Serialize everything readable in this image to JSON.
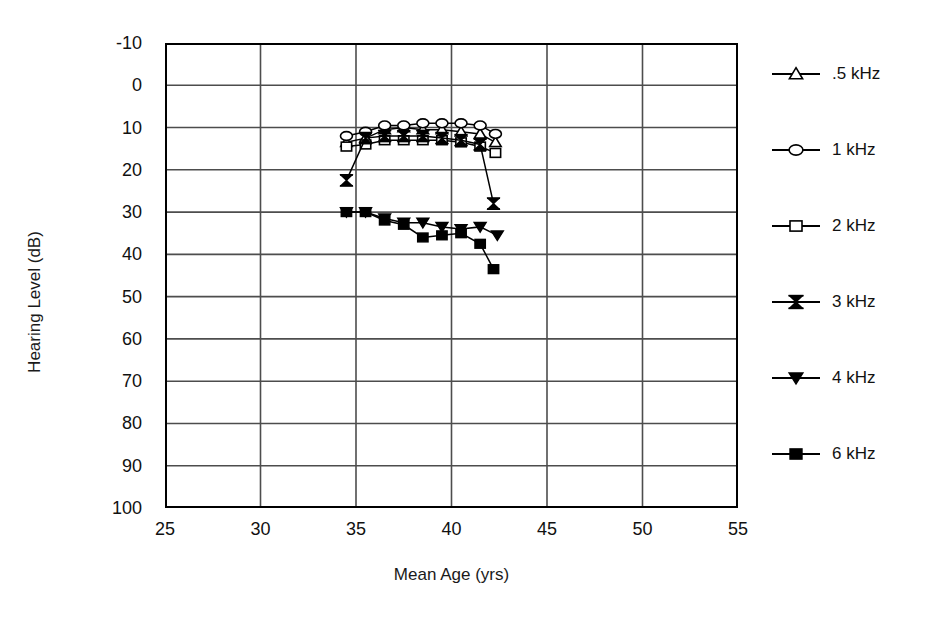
{
  "chart_data": {
    "type": "line",
    "title": "",
    "xlabel": "Mean Age (yrs)",
    "ylabel": "Hearing Level (dB)",
    "xlim": [
      25,
      55
    ],
    "ylim": [
      -10,
      100
    ],
    "y_inverted": true,
    "xticks": [
      25,
      30,
      35,
      40,
      45,
      50,
      55
    ],
    "yticks": [
      -10,
      0,
      10,
      20,
      30,
      40,
      50,
      60,
      70,
      80,
      90,
      100
    ],
    "grid": "both",
    "legend_position": "right",
    "series": [
      {
        "name": ".5 kHz",
        "marker": "open-triangle",
        "x": [
          34.5,
          35.5,
          36.5,
          37.5,
          38.5,
          39.5,
          40.5,
          41.5,
          42.3
        ],
        "y": [
          13.5,
          12.5,
          10.5,
          10.0,
          10.5,
          10.5,
          11.0,
          11.5,
          13.5
        ]
      },
      {
        "name": "1 kHz",
        "marker": "open-circle",
        "x": [
          34.5,
          35.5,
          36.5,
          37.5,
          38.5,
          39.5,
          40.5,
          41.5,
          42.3
        ],
        "y": [
          12.0,
          11.0,
          9.5,
          9.5,
          9.0,
          9.0,
          9.0,
          9.5,
          11.5
        ]
      },
      {
        "name": "2 kHz",
        "marker": "open-square",
        "x": [
          34.5,
          35.5,
          36.5,
          37.5,
          38.5,
          39.5,
          40.5,
          41.5,
          42.3
        ],
        "y": [
          14.5,
          14.0,
          13.0,
          13.0,
          13.0,
          13.0,
          13.5,
          14.5,
          16.0
        ]
      },
      {
        "name": "3 kHz",
        "marker": "filled-bowtie",
        "x": [
          34.5,
          35.5,
          36.5,
          37.5,
          38.5,
          39.5,
          40.5,
          41.5,
          42.2
        ],
        "y": [
          22.5,
          12.5,
          12.0,
          12.0,
          12.0,
          12.5,
          13.0,
          14.0,
          28.0
        ]
      },
      {
        "name": "4 kHz",
        "marker": "filled-down-triangle",
        "x": [
          34.5,
          35.5,
          36.5,
          37.5,
          38.5,
          39.5,
          40.5,
          41.5,
          42.4
        ],
        "y": [
          30.0,
          30.0,
          31.5,
          32.5,
          32.5,
          33.5,
          34.0,
          33.5,
          35.5
        ]
      },
      {
        "name": "6 kHz",
        "marker": "filled-square",
        "x": [
          34.5,
          35.5,
          36.5,
          37.5,
          38.5,
          39.5,
          40.5,
          41.5,
          42.2
        ],
        "y": [
          30.0,
          30.0,
          32.0,
          33.0,
          36.0,
          35.5,
          35.0,
          37.5,
          43.5
        ]
      }
    ]
  },
  "legend": {
    "items": [
      {
        "label": ".5 kHz",
        "marker": "open-triangle"
      },
      {
        "label": "1 kHz",
        "marker": "open-circle"
      },
      {
        "label": "2 kHz",
        "marker": "open-square"
      },
      {
        "label": "3 kHz",
        "marker": "filled-bowtie"
      },
      {
        "label": "4 kHz",
        "marker": "filled-down-triangle"
      },
      {
        "label": "6 kHz",
        "marker": "filled-square"
      }
    ]
  },
  "colors": {
    "line": "#000000",
    "grid": "#4d4d4d",
    "frame": "#000000",
    "background": "#ffffff"
  }
}
